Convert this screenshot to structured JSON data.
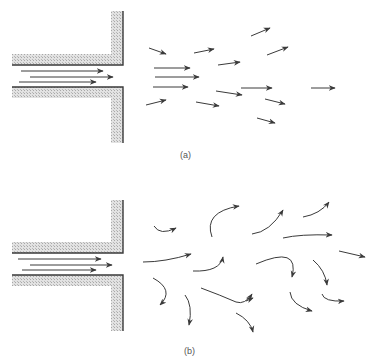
{
  "figure": {
    "colors": {
      "wall_fill": "#d4d4d4",
      "wall_edge": "#3a3a3a",
      "arrow": "#3a3a3a",
      "background": "#ffffff"
    },
    "panels": [
      {
        "id": "a",
        "caption": "(a)",
        "caption_pos": [
          180,
          151
        ],
        "title": "laminar jet",
        "walls": {
          "upper_vertical": [
            111,
            11,
            12,
            54
          ],
          "upper_horizontal": [
            12,
            54,
            111,
            11
          ],
          "lower_horizontal": [
            12,
            87,
            111,
            11
          ],
          "lower_vertical": [
            111,
            87,
            12,
            56
          ],
          "upper_edge": "M12,65 L123,65 L123,11",
          "lower_edge": "M12,87 L123,87 L123,143"
        },
        "arrows": [
          "M21,71 L103,71",
          "M30,77 L113,77",
          "M19,82 L96,82",
          "M149,48 L166,54",
          "M154,68 L190,68",
          "M155,77 L199,77",
          "M153,87 L188,87",
          "M146,105 L166,100",
          "M194,53 L214,49",
          "M218,65 L240,62",
          "M216,91 L242,95",
          "M196,102 L219,106",
          "M241,88 L272,88",
          "M251,36 L270,28",
          "M267,55 L288,47",
          "M265,99 L285,104",
          "M257,118 L275,123",
          "M311,88 L335,88"
        ]
      },
      {
        "id": "b",
        "caption": "(b)",
        "caption_pos": [
          184,
          347
        ],
        "title": "turbulent jet",
        "walls": {
          "upper_vertical": [
            111,
            200,
            12,
            42
          ],
          "upper_horizontal": [
            12,
            242,
            111,
            11
          ],
          "lower_horizontal": [
            12,
            275,
            111,
            11
          ],
          "lower_vertical": [
            111,
            275,
            12,
            56
          ],
          "upper_edge": "M12,253 L123,253 L123,200",
          "lower_edge": "M12,275 L123,275 L123,331"
        },
        "arrows": [
          "M18,259 L101,259",
          "M30,265 L112,265",
          "M22,270 L96,270",
          "M154,226 Q160,236 176,228",
          "M143,262 Q165,262 191,254",
          "M212,237 Q203,212 239,206",
          "M193,271 Q220,272 223,257",
          "M153,278 Q175,290 160,305",
          "M185,295 Q193,305 189,325",
          "M201,288 Q220,295 236,302 Q245,305 252,294",
          "M252,234 Q270,232 283,210",
          "M303,217 Q320,214 329,202",
          "M283,238 Q300,234 332,235",
          "M256,264 Q300,245 292,277",
          "M313,260 Q325,270 327,285",
          "M339,251 L365,257",
          "M236,313 Q250,320 253,332",
          "M290,292 Q291,305 312,311",
          "M322,294 Q324,302 344,301",
          "M246,301 L253,298"
        ]
      }
    ]
  }
}
